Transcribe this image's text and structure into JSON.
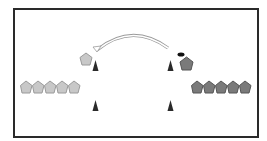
{
  "diagram": {
    "type": "sports-drill",
    "colors": {
      "frame": "#2a2a2a",
      "team_light": "#c8c8c8",
      "team_light_stroke": "#9a9a9a",
      "team_dark": "#7a7a7a",
      "team_dark_stroke": "#555555",
      "cone": "#2a2a2a",
      "ball": "#111111",
      "arrow_stroke": "#9a9a9a"
    },
    "teams": {
      "left_queue": {
        "player_count": 5,
        "shade": "light"
      },
      "right_queue": {
        "player_count": 5,
        "shade": "dark"
      }
    },
    "active_players": [
      {
        "side": "left",
        "shade": "light"
      },
      {
        "side": "right",
        "shade": "dark",
        "has_ball": true
      }
    ],
    "cones": 4,
    "arrow": {
      "direction": "right-to-left",
      "style": "curved-pass"
    }
  }
}
